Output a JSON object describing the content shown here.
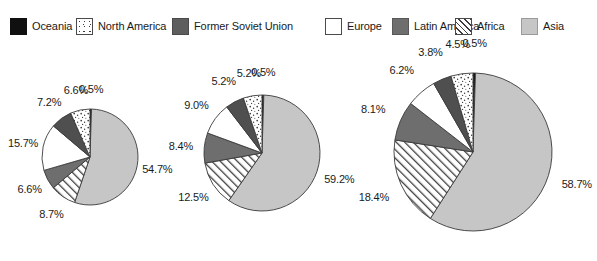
{
  "legend": {
    "items": [
      {
        "label": "Oceania",
        "key": "oceania",
        "swatch": "solid-black",
        "color": "#101010"
      },
      {
        "label": "North America",
        "key": "northamerica",
        "swatch": "dotted-white",
        "color": "#ffffff"
      },
      {
        "label": "Former Soviet Union",
        "key": "fsu",
        "swatch": "solid-darkgray",
        "color": "#5e5e5e"
      },
      {
        "label": "Europe",
        "key": "europe",
        "swatch": "plain-white",
        "color": "#ffffff"
      },
      {
        "label": "Latin America",
        "key": "latinamerica",
        "swatch": "solid-gray",
        "color": "#6e6e6e"
      },
      {
        "label": "Africa",
        "key": "africa",
        "swatch": "diagonal-hatch",
        "color": "#ffffff"
      },
      {
        "label": "Asia",
        "key": "asia",
        "swatch": "solid-lightgray",
        "color": "#c6c6c6"
      }
    ]
  },
  "chart_data": [
    {
      "type": "pie",
      "title": "",
      "name": "pie-1",
      "categories": [
        "Oceania",
        "Asia",
        "Africa",
        "Latin America",
        "Europe",
        "Former Soviet Union",
        "North America"
      ],
      "values": [
        0.5,
        54.7,
        8.7,
        6.6,
        15.7,
        7.2,
        6.6
      ],
      "labels": [
        "0.5%",
        "54.7%",
        "8.7%",
        "6.6%",
        "15.7%",
        "7.2%",
        "6.6%"
      ],
      "start_angle": 0,
      "direction": "clockwise",
      "legend_position": "top"
    },
    {
      "type": "pie",
      "title": "",
      "name": "pie-2",
      "categories": [
        "Oceania",
        "Asia",
        "Africa",
        "Latin America",
        "Europe",
        "Former Soviet Union",
        "North America"
      ],
      "values": [
        0.5,
        59.2,
        12.5,
        8.4,
        9.0,
        5.2,
        5.2
      ],
      "labels": [
        "0.5%",
        "59.2%",
        "12.5%",
        "8.4%",
        "9.0%",
        "5.2%",
        "5.2%"
      ],
      "start_angle": 0,
      "direction": "clockwise",
      "legend_position": "top"
    },
    {
      "type": "pie",
      "title": "",
      "name": "pie-3",
      "categories": [
        "Oceania",
        "Asia",
        "Africa",
        "Latin America",
        "Europe",
        "Former Soviet Union",
        "North America"
      ],
      "values": [
        0.5,
        58.7,
        18.4,
        8.1,
        6.2,
        3.8,
        4.5
      ],
      "labels": [
        "0.5%",
        "58.7%",
        "18.4%",
        "8.1%",
        "6.2%",
        "3.8%",
        "4.5%"
      ],
      "start_angle": 0,
      "direction": "clockwise",
      "legend_position": "top"
    }
  ],
  "geometry": {
    "pies": [
      {
        "cx": 90,
        "cy": 118,
        "r": 48
      },
      {
        "cx": 262,
        "cy": 114,
        "r": 58
      },
      {
        "cx": 473,
        "cy": 113,
        "r": 79
      }
    ],
    "label_radius_factor": 1.3
  },
  "palette": {
    "oceania": "#101010",
    "northamerica": "#ffffff",
    "fsu": "#4f4f4f",
    "europe": "#ffffff",
    "latinamerica": "#6e6e6e",
    "africa": "#ffffff",
    "asia": "#c6c6c6",
    "outline": "#3a3a3a"
  }
}
